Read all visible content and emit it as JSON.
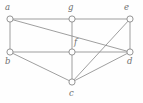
{
  "figure": {
    "type": "undirected-graph-diagram",
    "background_color": "#fefefe",
    "edge_color": "#8e8e8e",
    "vertex_fill_color": "#fdfdfd",
    "vertex_stroke_color": "#8a8a8a",
    "label_color": "#6f6f6f",
    "width": 143,
    "height": 103
  },
  "vertices": [
    {
      "id": "a",
      "label": "a",
      "cx": 10,
      "cy": 19,
      "r": 3.1,
      "label_x": 5,
      "label_y": 3
    },
    {
      "id": "g",
      "label": "g",
      "cx": 72,
      "cy": 19,
      "r": 3.1,
      "label_x": 68,
      "label_y": 3
    },
    {
      "id": "e",
      "label": "e",
      "cx": 130,
      "cy": 19,
      "r": 3.1,
      "label_x": 124,
      "label_y": 3
    },
    {
      "id": "b",
      "label": "b",
      "cx": 10,
      "cy": 52,
      "r": 3.1,
      "label_x": 5,
      "label_y": 57
    },
    {
      "id": "f",
      "label": "f",
      "cx": 72,
      "cy": 52,
      "r": 3.1,
      "label_x": 74,
      "label_y": 38
    },
    {
      "id": "d",
      "label": "d",
      "cx": 130,
      "cy": 52,
      "r": 3.1,
      "label_x": 127,
      "label_y": 57
    },
    {
      "id": "c",
      "label": "c",
      "cx": 72,
      "cy": 82,
      "r": 3.1,
      "label_x": 69,
      "label_y": 89
    }
  ],
  "edges": [
    {
      "id": "a-g",
      "from": "a",
      "to": "g",
      "x1": 10,
      "y1": 19,
      "x2": 72,
      "y2": 19
    },
    {
      "id": "g-e",
      "from": "g",
      "to": "e",
      "x1": 72,
      "y1": 19,
      "x2": 130,
      "y2": 19
    },
    {
      "id": "a-b",
      "from": "a",
      "to": "b",
      "x1": 10,
      "y1": 19,
      "x2": 10,
      "y2": 52
    },
    {
      "id": "a-d",
      "from": "a",
      "to": "d",
      "x1": 10,
      "y1": 19,
      "x2": 130,
      "y2": 52
    },
    {
      "id": "g-f",
      "from": "g",
      "to": "f",
      "x1": 72,
      "y1": 19,
      "x2": 72,
      "y2": 52
    },
    {
      "id": "e-d",
      "from": "e",
      "to": "d",
      "x1": 130,
      "y1": 19,
      "x2": 130,
      "y2": 52
    },
    {
      "id": "b-f",
      "from": "b",
      "to": "f",
      "x1": 10,
      "y1": 52,
      "x2": 72,
      "y2": 52
    },
    {
      "id": "f-d",
      "from": "f",
      "to": "d",
      "x1": 72,
      "y1": 52,
      "x2": 130,
      "y2": 52
    },
    {
      "id": "b-c",
      "from": "b",
      "to": "c",
      "x1": 10,
      "y1": 52,
      "x2": 72,
      "y2": 82
    },
    {
      "id": "f-c",
      "from": "f",
      "to": "c",
      "x1": 72,
      "y1": 52,
      "x2": 72,
      "y2": 82
    },
    {
      "id": "c-d",
      "from": "c",
      "to": "d",
      "x1": 72,
      "y1": 82,
      "x2": 130,
      "y2": 52
    },
    {
      "id": "c-e",
      "from": "c",
      "to": "e",
      "x1": 72,
      "y1": 82,
      "x2": 130,
      "y2": 19
    }
  ]
}
